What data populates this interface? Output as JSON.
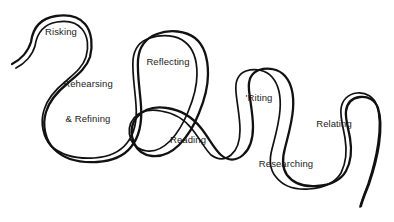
{
  "diagram": {
    "type": "hand-drawn-ribbon-loop-diagram",
    "background_color": "#ffffff",
    "stroke_color": "#111111",
    "label_color": "#1a1a1a",
    "canvas": {
      "width": 394,
      "height": 222
    },
    "ribbon": {
      "description": "A single continuous double-line ribbon that winds from a tail at the left, through seven labeled loops alternating upward arches and downward bulges, ending in a tail at the lower right.",
      "start_tail": {
        "x": 12,
        "y": 64
      },
      "end_tail": {
        "x": 361,
        "y": 206
      },
      "outer_path": "M 12 64 C 20 60 28 52 31 42 C 33 27 42 18 56 16 C 70 14 79 17 85 24 C 92 32 93 46 90 57 C 86 69 76 76 68 83 C 57 92 49 101 46 112 C 42 125 45 140 54 149 C 64 159 80 163 97 162 C 113 161 124 156 131 147 C 140 136 142 120 141 106 C 140 90 137 74 138 60 C 139 47 146 38 157 34 C 170 29 186 31 195 38 C 205 46 208 60 208 74 C 208 88 204 101 199 113 C 194 126 187 137 179 145 C 171 153 162 157 152 156 C 143 155 137 150 134 143 C 130 134 131 124 137 117 C 144 109 155 106 167 108 C 181 110 193 118 201 128 C 209 138 214 149 221 155 C 228 161 236 161 243 155 C 250 149 253 139 253 127 C 253 114 250 101 249 90 C 248 80 251 73 259 70 C 268 67 279 69 285 76 C 292 84 294 96 293 109 C 292 123 288 136 285 148 C 282 159 282 168 287 175 C 293 183 304 187 317 186 C 331 185 341 180 346 171 C 351 162 352 150 350 138 C 348 127 345 118 346 111 C 347 103 352 98 360 97 C 368 96 375 100 378 108 C 381 117 381 130 379 144 C 377 158 373 172 369 184 C 365 194 362 201 361 206",
      "inner_path": "M 16 68 C 24 64 32 56 35 46 C 37 32 45 24 57 22 C 69 20 77 23 82 29 C 88 36 89 47 86 57 C 83 67 74 74 66 81 C 55 90 47 99 44 110 C 40 123 43 137 51 146 C 61 155 77 159 94 158 C 109 157 120 152 127 143 C 135 133 137 118 136 105 C 135 89 132 73 133 60 C 134 49 140 41 150 38 C 162 34 177 35 185 42 C 194 49 197 61 197 74 C 197 87 193 100 188 112 C 183 124 177 134 170 141 C 163 148 155 152 147 151 C 139 150 134 146 131 140 C 128 132 129 124 134 118 C 140 111 150 109 161 111 C 174 113 185 120 192 129 C 200 139 205 149 211 155 C 218 160 225 160 231 155 C 237 150 240 141 240 130 C 240 117 237 104 236 92 C 235 82 238 74 246 71 C 255 68 266 70 272 77 C 279 85 281 97 280 110 C 279 124 275 137 272 149 C 269 160 270 170 276 177 C 283 186 295 190 309 189 C 324 188 335 183 341 173 C 346 163 347 150 345 138 C 343 126 340 117 341 109 C 342 100 348 94 357 93 C 366 92 374 97 377 106 C 380 115 380 129 378 143 C 376 157 372 172 368 184 C 364 195 361 202 360 207"
    },
    "loops": [
      {
        "id": "risking",
        "orientation": "up-arch",
        "label_lines": [
          "Risking"
        ],
        "label_x": 61,
        "label_y": 32
      },
      {
        "id": "rehearsing-refining",
        "orientation": "down-bulge",
        "label_lines": [
          "Rehearsing",
          "& Refining"
        ],
        "label_x": 88,
        "label_y": 101
      },
      {
        "id": "reflecting",
        "orientation": "up-arch",
        "label_lines": [
          "Reflecting"
        ],
        "label_x": 168,
        "label_y": 62
      },
      {
        "id": "reading",
        "orientation": "down-bulge",
        "label_lines": [
          "Reading"
        ],
        "label_x": 188,
        "label_y": 140
      },
      {
        "id": "riting",
        "orientation": "up-arch",
        "label_lines": [
          "'Riting"
        ],
        "label_x": 259,
        "label_y": 98
      },
      {
        "id": "researching",
        "orientation": "down-bulge",
        "label_lines": [
          "Researching"
        ],
        "label_x": 286,
        "label_y": 164
      },
      {
        "id": "relating",
        "orientation": "up-arch",
        "label_lines": [
          "Relating"
        ],
        "label_x": 334,
        "label_y": 124
      }
    ]
  }
}
